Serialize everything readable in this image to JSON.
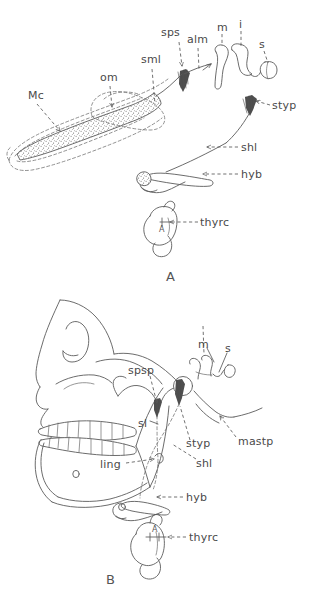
{
  "figure": {
    "background_color": "#ffffff",
    "ink_color": "#5b5b5b",
    "caption": "",
    "panels": [
      {
        "id": "A",
        "letter": "A",
        "description": "Embryonic / fetal stage: Meckel's cartilage, ossicles, styloid process, hyoid and thyroid cartilage",
        "labels": [
          {
            "key": "Mc",
            "text": "Mc",
            "tip_x": 60,
            "tip_y": 118,
            "lx": 28,
            "ly": 99,
            "leader": "dashed"
          },
          {
            "key": "om",
            "text": "om",
            "tip_x": 110,
            "tip_y": 109,
            "lx": 100,
            "ly": 81,
            "leader": "dashed"
          },
          {
            "key": "sml",
            "text": "sml",
            "tip_x": 154,
            "tip_y": 110,
            "lx": 141,
            "ly": 63,
            "leader": "dashed"
          },
          {
            "key": "sps",
            "text": "sps",
            "tip_x": 181,
            "tip_y": 68,
            "lx": 161,
            "ly": 36,
            "leader": "dashed"
          },
          {
            "key": "alm",
            "text": "alm",
            "tip_x": 200,
            "tip_y": 72,
            "lx": 187,
            "ly": 43,
            "leader": "dashed"
          },
          {
            "key": "m",
            "text": "m",
            "tip_x": 222,
            "tip_y": 52,
            "lx": 217,
            "ly": 31,
            "leader": "dashed"
          },
          {
            "key": "i",
            "text": "i",
            "tip_x": 241,
            "tip_y": 50,
            "lx": 240,
            "ly": 28,
            "leader": "dashed"
          },
          {
            "key": "s",
            "text": "s",
            "tip_x": 263,
            "tip_y": 68,
            "lx": 258,
            "ly": 48,
            "leader": "dashed"
          },
          {
            "key": "styp",
            "text": "styp",
            "tip_x": 253,
            "tip_y": 105,
            "lx": 272,
            "ly": 108,
            "leader": "dashed"
          },
          {
            "key": "shl",
            "text": "shl",
            "tip_x": 205,
            "tip_y": 147,
            "lx": 240,
            "ly": 150,
            "leader": "dashed"
          },
          {
            "key": "hyb",
            "text": "hyb",
            "tip_x": 200,
            "tip_y": 174,
            "lx": 240,
            "ly": 177,
            "leader": "dashed"
          },
          {
            "key": "thyrc",
            "text": "thyrc",
            "tip_x": 168,
            "tip_y": 222,
            "lx": 200,
            "ly": 225,
            "leader": "dashed"
          }
        ],
        "inner_marks": [
          {
            "key": "A-arrow",
            "text": "A",
            "x": 173,
            "y": 233
          }
        ]
      },
      {
        "id": "B",
        "letter": "B",
        "description": "Adult skull in lateral view: sphenomandibular ligament, lingula, stylohyoid ligament, mastoid process, hyoid and thyroid cartilage",
        "labels": [
          {
            "key": "spsp",
            "text": "spsp",
            "tip_x": 158,
            "tip_y": 405,
            "lx": 128,
            "ly": 371,
            "leader": "dashed"
          },
          {
            "key": "m",
            "text": "m",
            "tip_x": 215,
            "tip_y": 365,
            "lx": 200,
            "ly": 345,
            "leader": "solid"
          },
          {
            "key": "s",
            "text": "s",
            "tip_x": 216,
            "tip_y": 375,
            "lx": 227,
            "ly": 349,
            "leader": "solid"
          },
          {
            "key": "sl",
            "text": "sl",
            "tip_x": 158,
            "tip_y": 424,
            "lx": 140,
            "ly": 424,
            "leader": "solid"
          },
          {
            "key": "ling",
            "text": "ling",
            "tip_x": 158,
            "tip_y": 462,
            "lx": 104,
            "ly": 466,
            "leader": "dashed"
          },
          {
            "key": "styp",
            "text": "styp",
            "tip_x": 193,
            "tip_y": 405,
            "lx": 188,
            "ly": 443,
            "leader": "dashed"
          },
          {
            "key": "shl",
            "text": "shl",
            "tip_x": 171,
            "tip_y": 443,
            "lx": 196,
            "ly": 463,
            "leader": "dashed"
          },
          {
            "key": "mastp",
            "text": "mastp",
            "tip_x": 220,
            "tip_y": 420,
            "lx": 238,
            "ly": 441,
            "leader": "dashed"
          },
          {
            "key": "hyb",
            "text": "hyb",
            "tip_x": 155,
            "tip_y": 497,
            "lx": 185,
            "ly": 500,
            "leader": "dashed"
          },
          {
            "key": "thyrc",
            "text": "thyrc",
            "tip_x": 166,
            "tip_y": 537,
            "lx": 188,
            "ly": 540,
            "leader": "dashed"
          }
        ],
        "inner_marks": [
          {
            "key": "mental-foramen",
            "text": "o",
            "x": 75,
            "y": 477
          },
          {
            "key": "A-arrow",
            "text": "A",
            "x": 161,
            "y": 529
          }
        ]
      }
    ],
    "abbreviations": [
      {
        "key": "Mc",
        "label": "Mc"
      },
      {
        "key": "om",
        "label": "om"
      },
      {
        "key": "sml",
        "label": "sml"
      },
      {
        "key": "sps",
        "label": "sps"
      },
      {
        "key": "alm",
        "label": "alm"
      },
      {
        "key": "m",
        "label": "m"
      },
      {
        "key": "i",
        "label": "i"
      },
      {
        "key": "s",
        "label": "s"
      },
      {
        "key": "styp",
        "label": "styp"
      },
      {
        "key": "shl",
        "label": "shl"
      },
      {
        "key": "hyb",
        "label": "hyb"
      },
      {
        "key": "thyrc",
        "label": "thyrc"
      },
      {
        "key": "spsp",
        "label": "spsp"
      },
      {
        "key": "sl",
        "label": "sl"
      },
      {
        "key": "ling",
        "label": "ling"
      },
      {
        "key": "mastp",
        "label": "mastp"
      }
    ]
  }
}
